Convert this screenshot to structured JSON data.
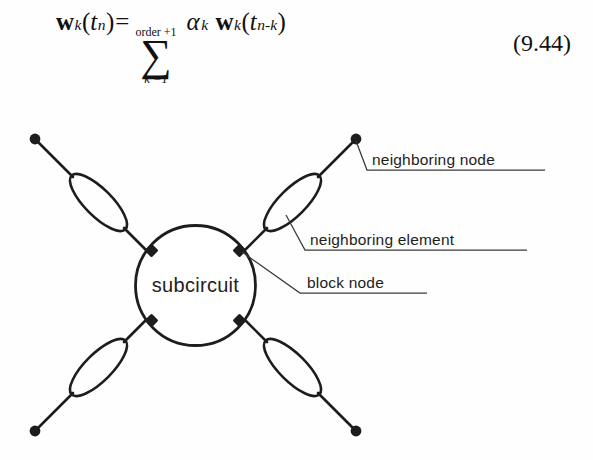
{
  "equation": {
    "lhs_vector": "w",
    "lhs_sub": "k",
    "lhs_open": "(",
    "lhs_arg": "t",
    "lhs_arg_sub": "n",
    "lhs_close": ")",
    "equals": "=",
    "sum_glyph": "∑",
    "sum_upper": "order +1",
    "sum_lower": "k =1",
    "coefficient": "α",
    "coefficient_sub": "k",
    "rhs_vector": "w",
    "rhs_sub": "k",
    "rhs_open": "(",
    "rhs_arg": "t",
    "rhs_arg_sub": "n-k",
    "rhs_close": ")",
    "number": "(9.44)"
  },
  "diagram": {
    "center_label": "subcircuit",
    "labels": [
      {
        "id": "neighboring-node",
        "text": "neighboring node"
      },
      {
        "id": "neighboring-element",
        "text": "neighboring element"
      },
      {
        "id": "block-node",
        "text": "block node"
      }
    ],
    "colors": {
      "ink": "#1d1d1d",
      "background": "#fefefe",
      "leader": "#3a3a3a"
    },
    "counts": {
      "branches": 4,
      "block_nodes": 4,
      "neighbor_nodes": 4,
      "elements": 4
    }
  }
}
